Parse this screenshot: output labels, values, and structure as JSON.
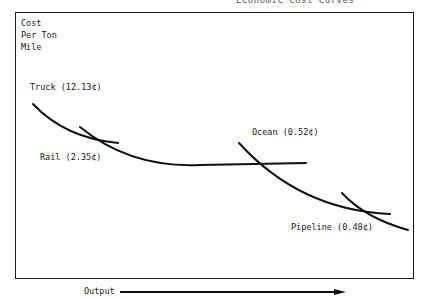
{
  "header": {
    "partial_text": "Economic Cost Curves"
  },
  "diagram": {
    "y_axis_label": [
      "Cost",
      "Per Ton",
      "Mile"
    ],
    "x_axis_label": "Output",
    "modes": [
      {
        "name": "Truck",
        "cost": "12.13¢",
        "label": "Truck (12.13¢)"
      },
      {
        "name": "Rail",
        "cost": "2.35¢",
        "label": "Rail (2.35¢)"
      },
      {
        "name": "Ocean",
        "cost": "0.52¢",
        "label": "Ocean (0.52¢)"
      },
      {
        "name": "Pipeline",
        "cost": "0.48¢",
        "label": "Pipeline (0.48¢)"
      }
    ]
  }
}
